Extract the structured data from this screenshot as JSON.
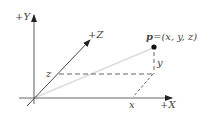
{
  "diagram": {
    "axes": {
      "y": {
        "label": "+Y"
      },
      "z": {
        "label": "+Z"
      },
      "x": {
        "label": "+X"
      }
    },
    "point": {
      "name": "p",
      "label_prefix": "p",
      "label_rest": "=(x, y, z)"
    },
    "components": {
      "x": "x",
      "y": "y",
      "z": "z"
    },
    "colors": {
      "axis": "#555555",
      "vector": "#dddddd",
      "dashed": "#666666",
      "point": "#111111",
      "text": "#444444"
    }
  }
}
